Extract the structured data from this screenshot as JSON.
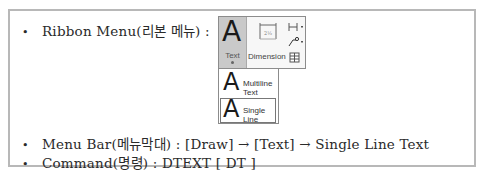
{
  "lines": {
    "ribbon": {
      "bullet": "•",
      "text": "Ribbon Menu(리본 메뉴) :"
    },
    "menubar": {
      "bullet": "•",
      "text": "Menu Bar(메뉴막대) : [Draw] → [Text] → Single Line Text"
    },
    "command": {
      "bullet": "•",
      "text": "Command(명령) : DTEXT  [ DT ]"
    }
  },
  "ribbon_panel": {
    "text_button_label": "Text",
    "text_button_glyph": "A",
    "dimension_label": "Dimension",
    "small_icons": [
      "linear-dimension-icon",
      "leader-icon",
      "table-icon"
    ]
  },
  "text_dropdown": {
    "items": [
      {
        "glyph": "A",
        "label": "Multiline Text"
      },
      {
        "glyph": "A",
        "label": "Single Line"
      }
    ]
  },
  "colors": {
    "border": "#b8b8b8",
    "button_active_bg": "#c9c9c9"
  }
}
